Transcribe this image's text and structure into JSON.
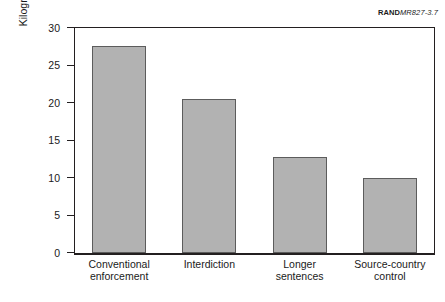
{
  "source_id": {
    "brand": "RAND",
    "document_number": "MR827-3.7"
  },
  "chart_data": {
    "type": "bar",
    "title": "",
    "subtitle": "",
    "xlabel": "",
    "ylabel": "Kilograms of consumption prevented per million dollars spent",
    "ylabel_line1": "Kilograms of consumption prevented",
    "ylabel_line2": "per million dollars spent",
    "categories": [
      "Conventional enforcement",
      "Interdiction",
      "Longer sentences",
      "Source-country control"
    ],
    "category_lines": [
      [
        "Conventional",
        "enforcement"
      ],
      [
        "Interdiction",
        ""
      ],
      [
        "Longer",
        "sentences"
      ],
      [
        "Source-country",
        "control"
      ]
    ],
    "values": [
      27.6,
      20.5,
      12.7,
      10.0
    ],
    "ylim": [
      0,
      30
    ],
    "yticks": [
      0,
      5,
      10,
      15,
      20,
      25,
      30
    ],
    "ytick_labels": [
      "0",
      "5",
      "10",
      "15",
      "20",
      "25",
      "30"
    ],
    "grid": false,
    "legend": false,
    "legend_position": "none",
    "bar_color": "#b2b2b2",
    "bar_edge_color": "#5c5c5c",
    "axis_color": "#231f20",
    "background_color": "#ffffff"
  }
}
